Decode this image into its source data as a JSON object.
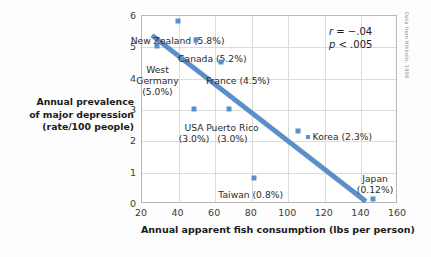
{
  "chart_data": {
    "type": "scatter",
    "title": "",
    "xlabel": "Annual apparent fish consumption (lbs per person)",
    "ylabel_lines": [
      "Annual prevalence",
      "of major depression",
      "(rate/100 people)"
    ],
    "xlim": [
      20,
      160
    ],
    "ylim": [
      0,
      6
    ],
    "xticks": [
      20,
      40,
      60,
      80,
      100,
      120,
      140,
      160
    ],
    "yticks": [
      0,
      1,
      2,
      3,
      4,
      5,
      6
    ],
    "grid": true,
    "legend": "none",
    "point_color": "#5b8fc9",
    "trendline_color": "#5b8fc9",
    "points": [
      {
        "name": "New Zealand",
        "x": 40,
        "y": 5.8,
        "label": "New Zealand (5.8%)",
        "label_x": 40,
        "label_y": 5.35,
        "align": "center",
        "swatch": false
      },
      {
        "name": "West Germany",
        "x": 29,
        "y": 5.0,
        "label": "West\nGermany\n(5.0%)",
        "label_x": 29,
        "label_y": 4.45,
        "align": "center",
        "swatch": false
      },
      {
        "name": "Canada",
        "x": 50,
        "y": 5.2,
        "label": "Canada (5.2%)",
        "label_x": 59,
        "label_y": 4.78,
        "align": "center",
        "swatch": false
      },
      {
        "name": "France",
        "x": 64,
        "y": 4.5,
        "label": "France (4.5%)",
        "label_x": 73,
        "label_y": 4.08,
        "align": "center",
        "swatch": false
      },
      {
        "name": "USA",
        "x": 49,
        "y": 3.0,
        "label": "USA\n(3.0%)",
        "label_x": 49,
        "label_y": 2.6,
        "align": "center",
        "swatch": false
      },
      {
        "name": "Puerto Rico",
        "x": 68,
        "y": 3.0,
        "label": "Puerto Rico\n(3.0%)",
        "label_x": 70,
        "label_y": 2.6,
        "align": "center",
        "swatch": false
      },
      {
        "name": "Korea",
        "x": 106,
        "y": 2.3,
        "label": "Korea (2.3%)",
        "label_x": 110,
        "label_y": 2.3,
        "align": "left",
        "swatch": true
      },
      {
        "name": "Taiwan",
        "x": 82,
        "y": 0.8,
        "label": "Taiwan (0.8%)",
        "label_x": 80,
        "label_y": 0.45,
        "align": "center",
        "swatch": false
      },
      {
        "name": "Japan",
        "x": 147,
        "y": 0.12,
        "label": "Japan\n(0.12%)",
        "label_x": 148,
        "label_y": 0.95,
        "align": "center",
        "swatch": false
      }
    ],
    "trendline": {
      "x1": 26,
      "y1": 5.35,
      "x2": 143,
      "y2": 0.05
    },
    "annotations": {
      "r_prefix": "r",
      "r_equals": "= −.04",
      "p_prefix": "p",
      "p_value": "< .005"
    },
    "source_credit": "Data from Hibbeln, 1998"
  }
}
